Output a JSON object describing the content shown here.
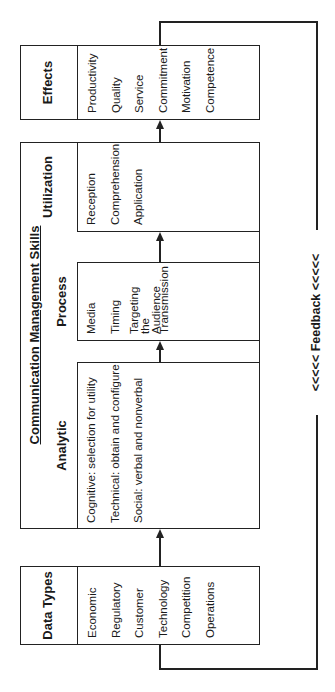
{
  "diagram": {
    "orientation": "rotated -90deg (text reads bottom-to-top)",
    "data_types": {
      "title": "Data Types",
      "items": [
        "Economic",
        "Regulatory",
        "Customer",
        "Technology",
        "Competition",
        "Operations"
      ]
    },
    "communication_management_skills": {
      "title": "Communication Management Skills",
      "analytic": {
        "title": "Analytic",
        "items": [
          "Cognitive: selection for utility",
          "Technical: obtain and configure",
          "Social: verbal and nonverbal"
        ]
      },
      "process": {
        "title": "Process",
        "items": [
          "Media",
          "Timing",
          "Targeting the Audience",
          "Transmission"
        ]
      },
      "utilization": {
        "title": "Utilization",
        "items": [
          "Reception",
          "Comprehension",
          "Application"
        ]
      }
    },
    "effects": {
      "title": "Effects",
      "items": [
        "Productivity",
        "Quality",
        "Service",
        "Commitment",
        "Motivation",
        "Competence"
      ]
    },
    "feedback": {
      "label": "<<<<<  Feedback  <<<<<"
    },
    "flow": [
      "Data Types",
      "Analytic",
      "Process",
      "Utilization",
      "Effects",
      "Feedback → Data Types"
    ],
    "colors": {
      "line": "#222222",
      "background": "#ffffff",
      "text": "#1a1a1a"
    }
  }
}
